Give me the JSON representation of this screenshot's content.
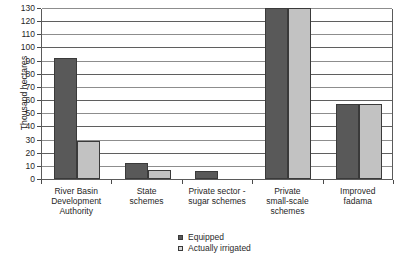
{
  "chart_data": {
    "type": "bar",
    "title": "",
    "xlabel": "",
    "ylabel": "Thousand hectares",
    "ylim": [
      0,
      130
    ],
    "ytick_step": 10,
    "yticks": [
      0,
      10,
      20,
      30,
      40,
      50,
      60,
      70,
      80,
      90,
      100,
      110,
      120,
      130
    ],
    "grid": true,
    "legend_position": "bottom",
    "categories": [
      "River Basin Development Authority",
      "State schemes",
      "Private sector - sugar schemes",
      "Private small-scale schemes",
      "Improved fadama"
    ],
    "series": [
      {
        "name": "Equipped",
        "color": "#595959",
        "values": [
          92,
          12,
          6,
          130,
          57
        ]
      },
      {
        "name": "Actually irrigated",
        "color": "#c2c2c2",
        "values": [
          29,
          7,
          0,
          130,
          57
        ]
      }
    ]
  },
  "axis": {
    "y_title": "Thousand hectares"
  },
  "category_labels": [
    [
      "River Basin",
      "Development",
      "Authority"
    ],
    [
      "State",
      "schemes"
    ],
    [
      "Private sector -",
      "sugar schemes"
    ],
    [
      "Private",
      "small-scale",
      "schemes"
    ],
    [
      "Improved",
      "fadama"
    ]
  ],
  "legend": {
    "items": [
      {
        "label": "Equipped",
        "swatch": "equipped"
      },
      {
        "label": "Actually irrigated",
        "swatch": "irrigated"
      }
    ]
  }
}
